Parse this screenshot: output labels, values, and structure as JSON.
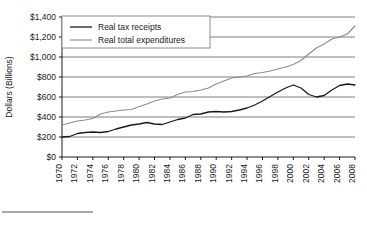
{
  "chart_data": {
    "type": "line",
    "title": "",
    "xlabel": "",
    "ylabel": "Dollars (Billions)",
    "ylim": [
      0,
      1400
    ],
    "ytick_labels": [
      "$0",
      "$200",
      "$400",
      "$600",
      "$800",
      "$1,000",
      "$1,200",
      "$1,400"
    ],
    "ytick_values": [
      0,
      200,
      400,
      600,
      800,
      1000,
      1200,
      1400
    ],
    "grid": true,
    "legend_position": "top-left-inside",
    "x": [
      1970,
      1971,
      1972,
      1973,
      1974,
      1975,
      1976,
      1977,
      1978,
      1979,
      1980,
      1981,
      1982,
      1983,
      1984,
      1985,
      1986,
      1987,
      1988,
      1989,
      1990,
      1991,
      1992,
      1993,
      1994,
      1995,
      1996,
      1997,
      1998,
      1999,
      2000,
      2001,
      2002,
      2003,
      2004,
      2005,
      2006,
      2007,
      2008
    ],
    "xtick_labels": [
      "1970",
      "1972",
      "1974",
      "1976",
      "1978",
      "1980",
      "1982",
      "1984",
      "1986",
      "1988",
      "1990",
      "1992",
      "1994",
      "1996",
      "1998",
      "2000",
      "2002",
      "2004",
      "2006",
      "2008"
    ],
    "series": [
      {
        "name": "Real tax receipts",
        "color": "#1a1a1a",
        "values": [
          200,
          205,
          235,
          245,
          250,
          245,
          255,
          280,
          300,
          320,
          330,
          345,
          330,
          325,
          350,
          375,
          390,
          425,
          430,
          450,
          455,
          450,
          455,
          470,
          490,
          520,
          560,
          605,
          650,
          690,
          720,
          690,
          625,
          600,
          615,
          670,
          715,
          730,
          720
        ]
      },
      {
        "name": "Real total expenditures",
        "color": "#8c8c8c",
        "values": [
          320,
          340,
          360,
          370,
          385,
          430,
          450,
          460,
          470,
          475,
          505,
          530,
          560,
          580,
          590,
          625,
          650,
          655,
          670,
          690,
          730,
          760,
          790,
          800,
          810,
          835,
          845,
          860,
          880,
          900,
          925,
          965,
          1030,
          1090,
          1130,
          1180,
          1200,
          1230,
          1310
        ]
      }
    ]
  },
  "legend": {
    "items": [
      {
        "label": "Real tax receipts",
        "color": "#1a1a1a"
      },
      {
        "label": "Real total expenditures",
        "color": "#8c8c8c"
      }
    ]
  },
  "footer": {
    "rule": ""
  }
}
